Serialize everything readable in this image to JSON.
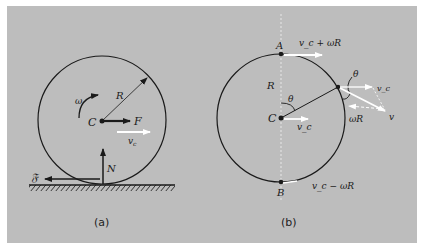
{
  "colors": {
    "background": "#bdbdbd",
    "ink": "#1a1a1a",
    "velocity_arrow": "#ffffff"
  },
  "panel_a": {
    "caption": "(a)",
    "labels": {
      "center": "C",
      "radius": "R",
      "angular_velocity": "ω",
      "applied_force": "F",
      "center_velocity": "v",
      "center_velocity_sub": "c",
      "normal_force": "N",
      "friction_force": "𝔉"
    }
  },
  "panel_b": {
    "caption": "(b)",
    "labels": {
      "top_point": "A",
      "bottom_point": "B",
      "center": "C",
      "radius": "R",
      "angle_center": "θ",
      "angle_rim": "θ",
      "top_velocity": "v_c + ωR",
      "bottom_velocity": "v_c − ωR",
      "center_velocity": "v_c",
      "rim_translation": "v_c",
      "rim_rotation": "ωR",
      "rim_resultant": "v"
    }
  }
}
